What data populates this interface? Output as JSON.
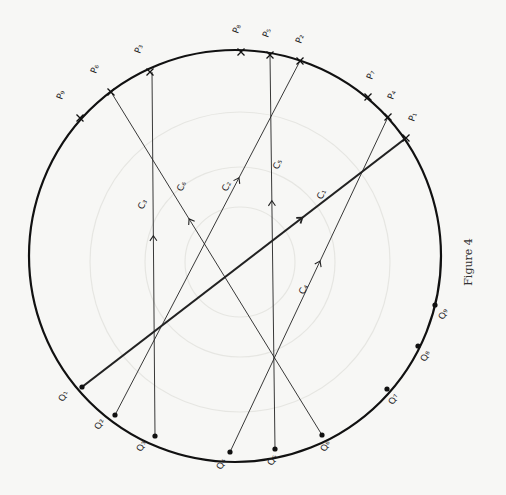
{
  "figure": {
    "caption": "Figure 4",
    "circle": {
      "cx": 235,
      "cy": 256,
      "r": 206,
      "stroke": "#111111"
    },
    "faint_circles": [
      {
        "cx": 240,
        "cy": 262,
        "r": 150
      },
      {
        "cx": 240,
        "cy": 262,
        "r": 95
      },
      {
        "cx": 240,
        "cy": 262,
        "r": 55
      }
    ],
    "p_points": [
      {
        "id": "P9",
        "label": "P₉",
        "x": 80,
        "y": 118,
        "lx": 62,
        "ly": 100,
        "rot": -70
      },
      {
        "id": "P6",
        "label": "P₆",
        "x": 111,
        "y": 92,
        "lx": 96,
        "ly": 74,
        "rot": -70
      },
      {
        "id": "P3",
        "label": "P₃",
        "x": 150,
        "y": 72,
        "lx": 140,
        "ly": 54,
        "rot": -70
      },
      {
        "id": "P8",
        "label": "P₈",
        "x": 241,
        "y": 52,
        "lx": 238,
        "ly": 34,
        "rot": -70
      },
      {
        "id": "P5",
        "label": "P₅",
        "x": 270,
        "y": 55,
        "lx": 268,
        "ly": 38,
        "rot": -70
      },
      {
        "id": "P2",
        "label": "P₂",
        "x": 300,
        "y": 61,
        "lx": 301,
        "ly": 44,
        "rot": -70
      },
      {
        "id": "P7",
        "label": "P₇",
        "x": 368,
        "y": 97,
        "lx": 372,
        "ly": 80,
        "rot": -70
      },
      {
        "id": "P4",
        "label": "P₄",
        "x": 388,
        "y": 117,
        "lx": 393,
        "ly": 100,
        "rot": -70
      },
      {
        "id": "P1",
        "label": "P₁",
        "x": 406,
        "y": 138,
        "lx": 414,
        "ly": 122,
        "rot": -70
      }
    ],
    "q_points": [
      {
        "id": "Q1",
        "label": "Q₁",
        "x": 82,
        "y": 387,
        "lx": 64,
        "ly": 402,
        "rot": -70
      },
      {
        "id": "Q2",
        "label": "Q₂",
        "x": 115,
        "y": 415,
        "lx": 100,
        "ly": 430,
        "rot": -70
      },
      {
        "id": "Q3",
        "label": "Q₃",
        "x": 155,
        "y": 436,
        "lx": 142,
        "ly": 452,
        "rot": -70
      },
      {
        "id": "Q4",
        "label": "Q₄",
        "x": 230,
        "y": 452,
        "lx": 222,
        "ly": 470,
        "rot": -70
      },
      {
        "id": "Q5",
        "label": "Q₅",
        "x": 275,
        "y": 449,
        "lx": 273,
        "ly": 466,
        "rot": -70
      },
      {
        "id": "Q6",
        "label": "Q₆",
        "x": 322,
        "y": 435,
        "lx": 326,
        "ly": 452,
        "rot": -70
      },
      {
        "id": "Q7",
        "label": "Q₇",
        "x": 387,
        "y": 389,
        "lx": 394,
        "ly": 405,
        "rot": -70
      },
      {
        "id": "Q8",
        "label": "Q₈",
        "x": 418,
        "y": 346,
        "lx": 426,
        "ly": 362,
        "rot": -70
      },
      {
        "id": "Q9",
        "label": "Q₉",
        "x": 435,
        "y": 305,
        "lx": 444,
        "ly": 320,
        "rot": -70
      }
    ],
    "chords": [
      {
        "id": "C1",
        "label": "C₁",
        "from": "Q1",
        "to": "P1",
        "thick": true,
        "x1": 82,
        "y1": 387,
        "x2": 406,
        "y2": 138,
        "arrow_t": 0.68,
        "lx": 322,
        "ly": 200
      },
      {
        "id": "C2",
        "label": "C₂",
        "from": "Q2",
        "to": "P2",
        "thick": false,
        "x1": 115,
        "y1": 415,
        "x2": 300,
        "y2": 61,
        "arrow_t": 0.67,
        "lx": 227,
        "ly": 192
      },
      {
        "id": "C3",
        "label": "C₃",
        "from": "Q3",
        "to": "P3",
        "thick": false,
        "x1": 155,
        "y1": 436,
        "x2": 152,
        "y2": 72,
        "arrow_t": 0.55,
        "lx": 143,
        "ly": 210
      },
      {
        "id": "C4",
        "label": "C₄",
        "from": "Q4",
        "to": "P4",
        "thick": false,
        "x1": 230,
        "y1": 452,
        "x2": 388,
        "y2": 117,
        "arrow_t": 0.57,
        "lx": 304,
        "ly": 295
      },
      {
        "id": "C5",
        "label": "C₅",
        "from": "Q5",
        "to": "P5",
        "thick": false,
        "x1": 275,
        "y1": 449,
        "x2": 270,
        "y2": 55,
        "arrow_t": 0.63,
        "lx": 278,
        "ly": 170
      },
      {
        "id": "C6",
        "label": "C₆",
        "from": "P6",
        "to": "Q6",
        "thick": false,
        "x1": 322,
        "y1": 435,
        "x2": 111,
        "y2": 92,
        "arrow_t": 0.63,
        "lx": 182,
        "ly": 192
      }
    ]
  }
}
